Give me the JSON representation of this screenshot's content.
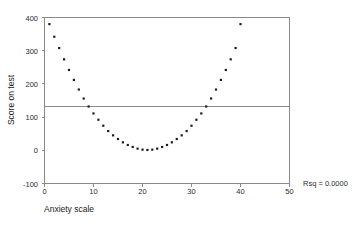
{
  "chart_data": {
    "type": "scatter",
    "title": "",
    "xlabel": "Anxiety scale",
    "ylabel": "Score on test",
    "xlim": [
      0,
      50
    ],
    "ylim": [
      -100,
      400
    ],
    "xticks": [
      0,
      10,
      20,
      30,
      40,
      50
    ],
    "yticks": [
      -100,
      0,
      100,
      200,
      300,
      400
    ],
    "xtick_labels": [
      "0",
      "10",
      "20",
      "30",
      "40",
      "50"
    ],
    "ytick_labels": [
      "-100",
      "0",
      "100",
      "200",
      "300",
      "400"
    ],
    "grid": false,
    "legend": null,
    "annotations": [
      {
        "name": "rsq-annotation",
        "text": "Rsq = 0.0000"
      }
    ],
    "reference_lines": [
      {
        "name": "regression-fit-line",
        "orientation": "horizontal",
        "y": 133,
        "label": "Fit line (flat, Rsq = 0.0000)"
      }
    ],
    "series": [
      {
        "name": "Score on test vs Anxiety scale",
        "marker": "dot",
        "color": "#1c1c1c",
        "x": [
          1,
          2,
          3,
          4,
          5,
          6,
          7,
          8,
          9,
          10,
          11,
          12,
          13,
          14,
          15,
          16,
          17,
          18,
          19,
          20,
          21,
          22,
          23,
          24,
          25,
          26,
          27,
          28,
          29,
          30,
          31,
          32,
          33,
          34,
          35,
          36,
          37,
          38,
          39,
          40
        ],
        "y": [
          380,
          342,
          308,
          274,
          242,
          212,
          183,
          156,
          132,
          111,
          92,
          74,
          58,
          45,
          34,
          24,
          16,
          10,
          5,
          2,
          1,
          2,
          5,
          10,
          16,
          24,
          34,
          45,
          58,
          74,
          92,
          111,
          132,
          156,
          183,
          212,
          242,
          274,
          308,
          380
        ]
      }
    ]
  },
  "annotation": {
    "rsq_label": "Rsq = 0.0000"
  },
  "axes": {
    "x_title": "Anxiety scale",
    "y_title": "Score on test"
  }
}
